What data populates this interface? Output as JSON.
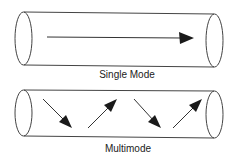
{
  "diagram": {
    "panels": [
      {
        "id": "single",
        "label": "Single Mode",
        "rays": [
          {
            "direction": "straight-right"
          }
        ]
      },
      {
        "id": "multi",
        "label": "Multimode",
        "rays": [
          {
            "direction": "down-right"
          },
          {
            "direction": "up-right"
          },
          {
            "direction": "down-right"
          },
          {
            "direction": "up-right"
          }
        ]
      }
    ],
    "colors": {
      "outline": "#444444",
      "arrow": "#1a1a1a",
      "text": "#222222",
      "background": "#ffffff"
    }
  }
}
